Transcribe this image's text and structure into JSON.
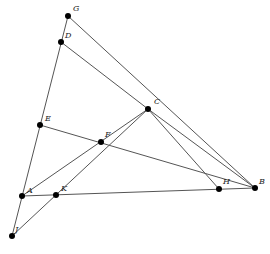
{
  "diagram": {
    "type": "geometry",
    "points": [
      {
        "id": "G",
        "x": 68,
        "y": 16,
        "lx": 73,
        "ly": 11
      },
      {
        "id": "D",
        "x": 61,
        "y": 42,
        "lx": 65,
        "ly": 38
      },
      {
        "id": "C",
        "x": 148,
        "y": 109,
        "lx": 154,
        "ly": 104
      },
      {
        "id": "E",
        "x": 40,
        "y": 125,
        "lx": 45,
        "ly": 121
      },
      {
        "id": "F",
        "x": 101,
        "y": 142,
        "lx": 105,
        "ly": 137
      },
      {
        "id": "A",
        "x": 22,
        "y": 196,
        "lx": 27,
        "ly": 193
      },
      {
        "id": "K",
        "x": 56,
        "y": 195,
        "lx": 61,
        "ly": 191
      },
      {
        "id": "J",
        "x": 12,
        "y": 236,
        "lx": 15,
        "ly": 232
      },
      {
        "id": "H",
        "x": 219,
        "y": 189,
        "lx": 223,
        "ly": 184
      },
      {
        "id": "B",
        "x": 255,
        "y": 188,
        "lx": 259,
        "ly": 184
      }
    ],
    "segments": [
      [
        "G",
        "J"
      ],
      [
        "G",
        "B"
      ],
      [
        "D",
        "C"
      ],
      [
        "E",
        "B"
      ],
      [
        "A",
        "C"
      ],
      [
        "J",
        "C"
      ],
      [
        "A",
        "B"
      ],
      [
        "C",
        "B"
      ],
      [
        "C",
        "H"
      ]
    ]
  }
}
